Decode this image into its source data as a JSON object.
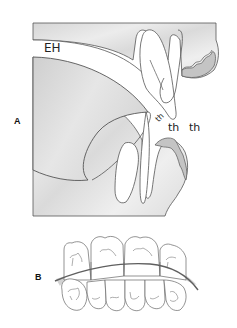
{
  "figure": {
    "panels": [
      {
        "id": "A",
        "label": "A",
        "description": "Sagittal view of oral cavity with tongue, incisors and lips",
        "annotations": [
          {
            "text": "EH",
            "role": "region-label"
          },
          {
            "text": "th",
            "role": "small-label-rotated"
          },
          {
            "text": "th",
            "role": "label"
          },
          {
            "text": "th",
            "role": "label"
          }
        ]
      },
      {
        "id": "B",
        "label": "B",
        "description": "Frontal view of upper and lower dental arches with occlusal curve"
      }
    ],
    "colors": {
      "background": "#ffffff",
      "tissue_fill": "#dedede",
      "tissue_light": "#ececec",
      "lip_fill": "#c8c8c8",
      "outline": "#555555",
      "curve": "#666666",
      "band_fill": "#d0d0d0"
    }
  }
}
